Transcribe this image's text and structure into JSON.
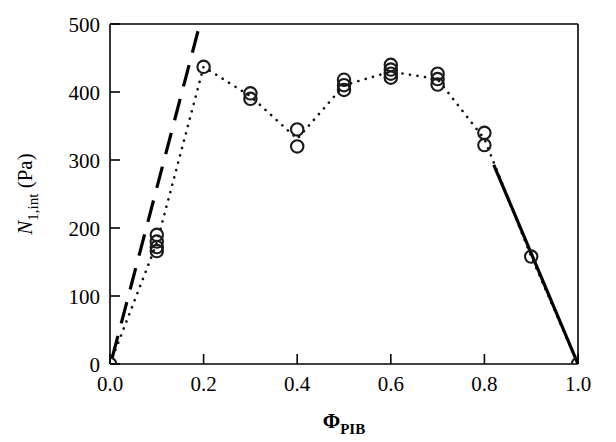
{
  "chart_data": {
    "type": "scatter",
    "title": "",
    "subtitle": "",
    "xlabel": "Φ",
    "xlabel_sub": "PIB",
    "ylabel": "N",
    "ylabel_sub": "1,int",
    "ylabel_unit": "(Pa)",
    "xlim": [
      0.0,
      1.0
    ],
    "ylim": [
      0,
      500
    ],
    "xticks": [
      0.0,
      0.2,
      0.4,
      0.6,
      0.8,
      1.0
    ],
    "xtick_labels": [
      "0.0",
      "0.2",
      "0.4",
      "0.6",
      "0.8",
      "1.0"
    ],
    "yticks": [
      0,
      100,
      200,
      300,
      400,
      500
    ],
    "ytick_labels": [
      "0",
      "100",
      "200",
      "300",
      "400",
      "500"
    ],
    "grid": false,
    "legend": "none",
    "marker": "open-circle",
    "series": [
      {
        "name": "N1,int data",
        "style": "open-circle markers with dotted connecting line",
        "points": [
          {
            "x": 0.0,
            "y": 0
          },
          {
            "x": 0.1,
            "y": 190
          },
          {
            "x": 0.1,
            "y": 180
          },
          {
            "x": 0.1,
            "y": 172
          },
          {
            "x": 0.1,
            "y": 166
          },
          {
            "x": 0.2,
            "y": 437
          },
          {
            "x": 0.3,
            "y": 398
          },
          {
            "x": 0.3,
            "y": 390
          },
          {
            "x": 0.4,
            "y": 345
          },
          {
            "x": 0.4,
            "y": 320
          },
          {
            "x": 0.5,
            "y": 418
          },
          {
            "x": 0.5,
            "y": 410
          },
          {
            "x": 0.5,
            "y": 403
          },
          {
            "x": 0.6,
            "y": 440
          },
          {
            "x": 0.6,
            "y": 433
          },
          {
            "x": 0.6,
            "y": 427
          },
          {
            "x": 0.6,
            "y": 421
          },
          {
            "x": 0.7,
            "y": 427
          },
          {
            "x": 0.7,
            "y": 419
          },
          {
            "x": 0.7,
            "y": 411
          },
          {
            "x": 0.8,
            "y": 340
          },
          {
            "x": 0.8,
            "y": 322
          },
          {
            "x": 0.9,
            "y": 158
          },
          {
            "x": 1.0,
            "y": 0
          }
        ]
      },
      {
        "name": "dotted trend curve",
        "style": "dotted",
        "points": [
          {
            "x": 0.0,
            "y": 0
          },
          {
            "x": 0.1,
            "y": 178
          },
          {
            "x": 0.2,
            "y": 437
          },
          {
            "x": 0.3,
            "y": 394
          },
          {
            "x": 0.4,
            "y": 331
          },
          {
            "x": 0.5,
            "y": 410
          },
          {
            "x": 0.6,
            "y": 430
          },
          {
            "x": 0.7,
            "y": 419
          },
          {
            "x": 0.8,
            "y": 331
          },
          {
            "x": 0.9,
            "y": 158
          },
          {
            "x": 1.0,
            "y": 0
          }
        ]
      },
      {
        "name": "left dashed limiting line",
        "style": "long-dashed",
        "points": [
          {
            "x": 0.005,
            "y": 10
          },
          {
            "x": 0.192,
            "y": 500
          }
        ]
      },
      {
        "name": "right solid limiting line",
        "style": "solid",
        "points": [
          {
            "x": 0.82,
            "y": 293
          },
          {
            "x": 1.0,
            "y": 0
          }
        ]
      }
    ]
  },
  "axes": {
    "x_tick_labels": [
      "0.0",
      "0.2",
      "0.4",
      "0.6",
      "0.8",
      "1.0"
    ],
    "y_tick_labels": [
      "0",
      "100",
      "200",
      "300",
      "400",
      "500"
    ]
  },
  "labels": {
    "y_axis_symbol": "N",
    "y_axis_subscript": "1,int",
    "y_axis_units": "(Pa)",
    "x_axis_symbol": "Φ",
    "x_axis_subscript": "PIB"
  },
  "colors": {
    "foreground": "#000000",
    "background": "#ffffff",
    "marker_stroke": "#1a1a1a"
  }
}
